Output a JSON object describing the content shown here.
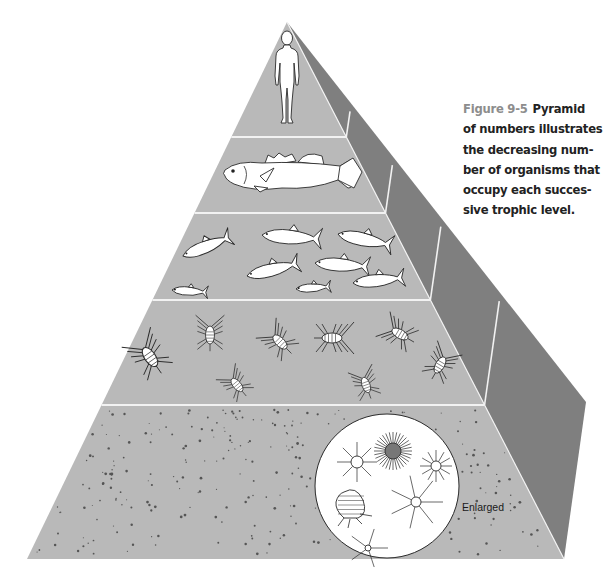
{
  "figure": {
    "number": "Figure 9-5",
    "caption_lines": [
      "Pyramid",
      "of numbers illustrates",
      "the decreasing num-",
      "ber of organisms that",
      "occupy each succes-",
      "sive trophic level."
    ],
    "caption_full": "Pyramid of numbers illustrates the decreasing number of organisms that occupy each successive trophic level."
  },
  "pyramid": {
    "colors": {
      "front_face": "#b9b9b9",
      "side_face": "#7f7f7f",
      "dividers": "#f2f2f2",
      "organism_fill": "#ffffff",
      "organism_stroke": "#2a2a2a",
      "speckle": "#555555"
    },
    "levels": [
      {
        "name": "Tertiary consumer",
        "organism": "human",
        "count": 1
      },
      {
        "name": "Secondary consumer",
        "organism": "large fish (bass)",
        "count": 1
      },
      {
        "name": "Primary consumer (fish)",
        "organism": "small fish",
        "count": 8
      },
      {
        "name": "Zooplankton",
        "organism": "copepods / crustaceans",
        "count": 9
      },
      {
        "name": "Producers",
        "organism": "phytoplankton (microscopic specks)",
        "count": "many"
      }
    ],
    "inset": {
      "label": "Enlarged",
      "organisms": [
        "radiolarian",
        "spiny radiolarian",
        "radiolarian",
        "diatom",
        "star radiolarian",
        "spiny cell"
      ]
    }
  }
}
